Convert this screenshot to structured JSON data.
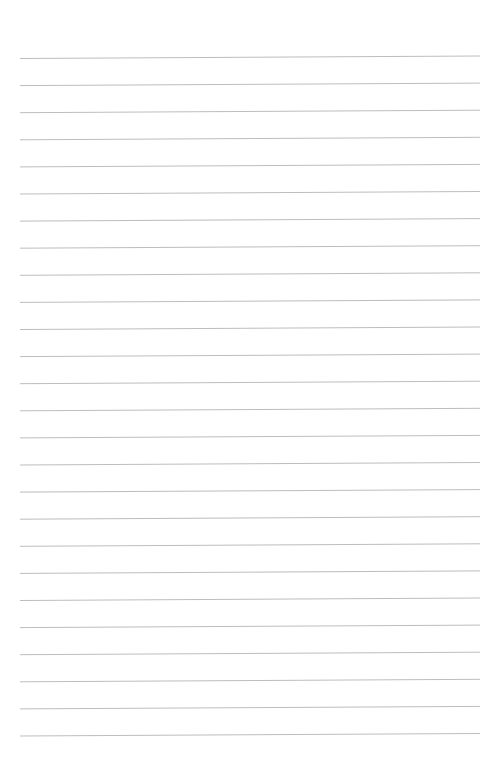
{
  "page": {
    "type": "lined-paper",
    "background_color": "#ffffff",
    "line_color": "#bdbdbd",
    "line_count": 26,
    "first_line_y": 58.5,
    "line_spacing": 27.1,
    "line_left_x": 20,
    "line_right_x": 480,
    "line_tilt_px": -2.5,
    "text_content": []
  }
}
